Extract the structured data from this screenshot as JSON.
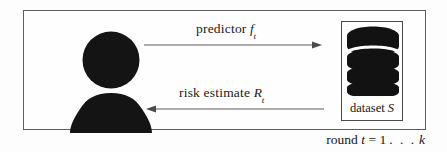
{
  "diagram": {
    "frame": {
      "border_color": "#5d5d5d",
      "background": "#fefefe"
    },
    "actor": {
      "icon": "person-silhouette-icon",
      "fill_color": "#151515"
    },
    "arrows": {
      "forward": {
        "direction": "right",
        "label_prefix": "predictor ",
        "label_symbol": "f",
        "label_subscript": "t",
        "label_full": "predictor f t",
        "color": "#555555"
      },
      "backward": {
        "direction": "left",
        "label_prefix": "risk estimate ",
        "label_symbol": "R",
        "label_subscript": "t",
        "label_full": "risk estimate R t",
        "color": "#555555"
      }
    },
    "dataset": {
      "icon": "database-cylinder-icon",
      "label_prefix": "dataset ",
      "label_symbol": "S",
      "label_full": "dataset S",
      "fill_color": "#121212",
      "border_color": "#4a4a4a"
    },
    "caption": {
      "prefix": "round ",
      "variable": "t",
      "equals": " = ",
      "start": "1",
      "ellipsis": ". . .",
      "end": "k",
      "full": "round t = 1 . . . k"
    }
  }
}
